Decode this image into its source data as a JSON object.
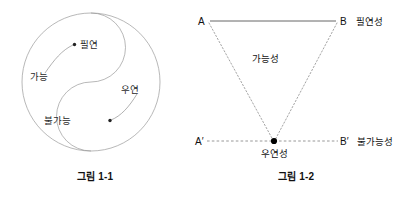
{
  "page": {
    "background_color": "#ffffff",
    "ink_color": "#2a2a2a",
    "line_color": "#9a9a9a"
  },
  "figure_1": {
    "caption": "그림 1-1",
    "shape_name": "taegeuk-yinyang-circle",
    "labels": {
      "top_inner": "필연",
      "left_outer": "가능",
      "right_outer": "우연",
      "bottom_inner": "불가능"
    },
    "pointers": [
      {
        "from": "가능",
        "to": "필연"
      },
      {
        "from": "우연",
        "to": "불가능"
      }
    ]
  },
  "figure_2": {
    "caption": "그림 1-2",
    "shape_name": "inverted-triangle",
    "vertices": {
      "top_left": "A",
      "top_right": "B",
      "bottom_left": "A′",
      "bottom_right": "B′"
    },
    "labels": {
      "top_side": "필연성",
      "interior": "가능성",
      "bottom_vertex": "우연성",
      "bottom_side": "불가능성"
    },
    "line_styles": {
      "top_edge": "solid",
      "left_edge": "dotted",
      "right_edge": "dotted",
      "baseline": "dashed"
    }
  }
}
